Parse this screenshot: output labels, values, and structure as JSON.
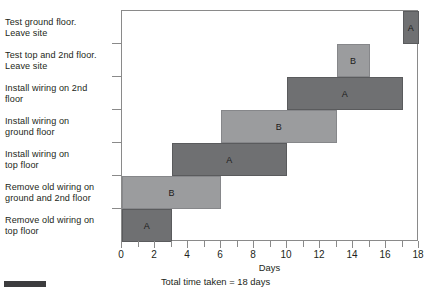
{
  "chart_data": {
    "type": "bar",
    "subtype": "gantt",
    "title": "",
    "xlabel": "Days",
    "ylabel": "",
    "xlim": [
      0,
      18
    ],
    "ylim": [
      0,
      7
    ],
    "xticks": [
      0,
      1,
      2,
      3,
      4,
      5,
      6,
      7,
      8,
      9,
      10,
      11,
      12,
      13,
      14,
      15,
      16,
      17,
      18
    ],
    "xtick_labels": [
      "0",
      "",
      "2",
      "",
      "4",
      "",
      "6",
      "",
      "8",
      "",
      "10",
      "",
      "12",
      "",
      "14",
      "",
      "16",
      "",
      "18"
    ],
    "grid": false,
    "legend": "none",
    "annotation": "Total time taken = 18 days",
    "categories": [
      "Remove old wiring on top floor",
      "Remove old wiring on ground and 2nd floor",
      "Install wiring on top floor",
      "Install wiring on ground floor",
      "Install wiring on 2nd floor",
      "Test top and 2nd floor. Leave site",
      "Test ground floor. Leave site"
    ],
    "tasks": [
      {
        "row": 0,
        "name": "Remove old wiring on top floor",
        "resource": "A",
        "start": 0,
        "end": 3,
        "duration": 3,
        "shade": "dark"
      },
      {
        "row": 1,
        "name": "Remove old wiring on ground and 2nd floor",
        "resource": "B",
        "start": 0,
        "end": 6,
        "duration": 6,
        "shade": "light"
      },
      {
        "row": 2,
        "name": "Install wiring on top floor",
        "resource": "A",
        "start": 3,
        "end": 10,
        "duration": 7,
        "shade": "dark"
      },
      {
        "row": 3,
        "name": "Install wiring on ground floor",
        "resource": "B",
        "start": 6,
        "end": 13,
        "duration": 7,
        "shade": "light"
      },
      {
        "row": 4,
        "name": "Install wiring on 2nd floor",
        "resource": "A",
        "start": 10,
        "end": 17,
        "duration": 7,
        "shade": "dark"
      },
      {
        "row": 5,
        "name": "Test top and 2nd floor. Leave site",
        "resource": "B",
        "start": 13,
        "end": 15,
        "duration": 2,
        "shade": "light"
      },
      {
        "row": 6,
        "name": "Test ground floor. Leave site",
        "resource": "A",
        "start": 17,
        "end": 18,
        "duration": 1,
        "shade": "dark"
      }
    ]
  },
  "task_labels": [
    {
      "line1": "Test ground floor.",
      "line2": "Leave site"
    },
    {
      "line1": "Test top and 2nd floor.",
      "line2": "Leave site"
    },
    {
      "line1": "Install wiring on 2nd",
      "line2": "floor"
    },
    {
      "line1": "Install wiring on",
      "line2": "ground floor"
    },
    {
      "line1": "Install wiring on",
      "line2": "top floor"
    },
    {
      "line1": "Remove old wiring on",
      "line2": "ground and 2nd floor"
    },
    {
      "line1": "Remove old wiring on",
      "line2": "top floor"
    }
  ],
  "axis": {
    "x_title": "Days",
    "tick_labels": [
      "0",
      "2",
      "4",
      "6",
      "8",
      "10",
      "12",
      "14",
      "16",
      "18"
    ]
  },
  "footnote": "Total time taken = 18 days",
  "colors": {
    "shade_dark": "#6f7072",
    "shade_light": "#9b9c9e",
    "axis": "#8a8a8a",
    "text": "#231f20"
  },
  "bar_letters": [
    "A",
    "B",
    "A",
    "B",
    "A",
    "B",
    "A"
  ]
}
